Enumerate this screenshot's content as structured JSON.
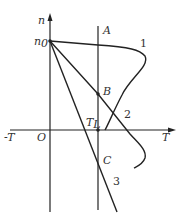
{
  "axes": {
    "vertical_label": "n",
    "horizontal_pos_label": "T",
    "horizontal_neg_label": "-T",
    "origin_label": "O"
  },
  "points": {
    "n0": "n₀",
    "A": "A",
    "B": "B",
    "C": "C",
    "TL": "T",
    "TL_sub": "L"
  },
  "curves": {
    "c1": "1",
    "c2": "2",
    "c3": "3"
  },
  "colors": {
    "stroke": "#222222"
  }
}
